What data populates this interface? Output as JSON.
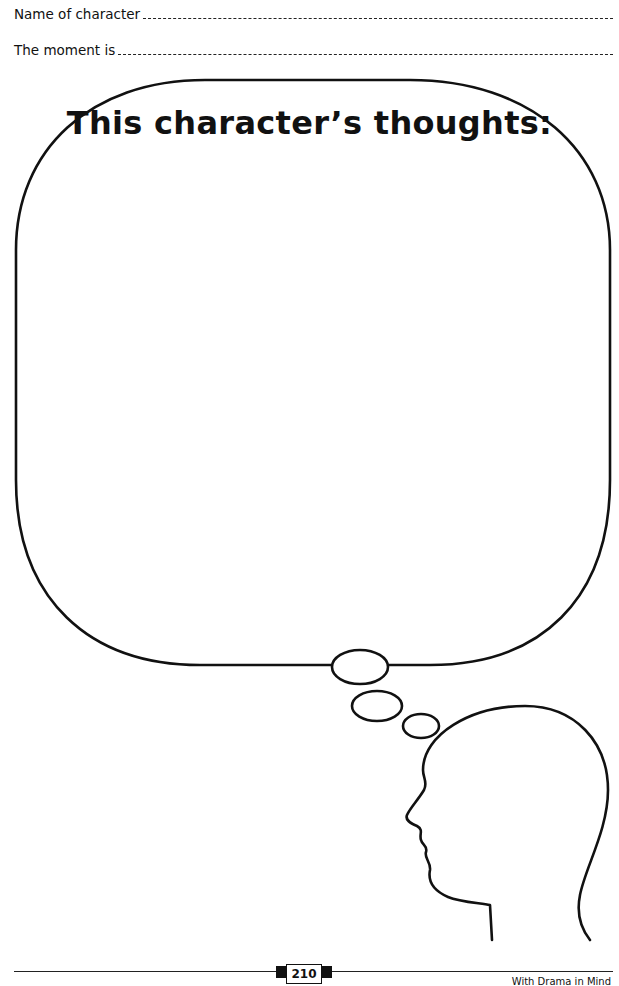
{
  "fields": {
    "name_label": "Name of character",
    "moment_label": "The moment is"
  },
  "bubble": {
    "title": "This character’s thoughts:"
  },
  "footer": {
    "page_number": "210",
    "book_title": "With Drama in Mind"
  }
}
